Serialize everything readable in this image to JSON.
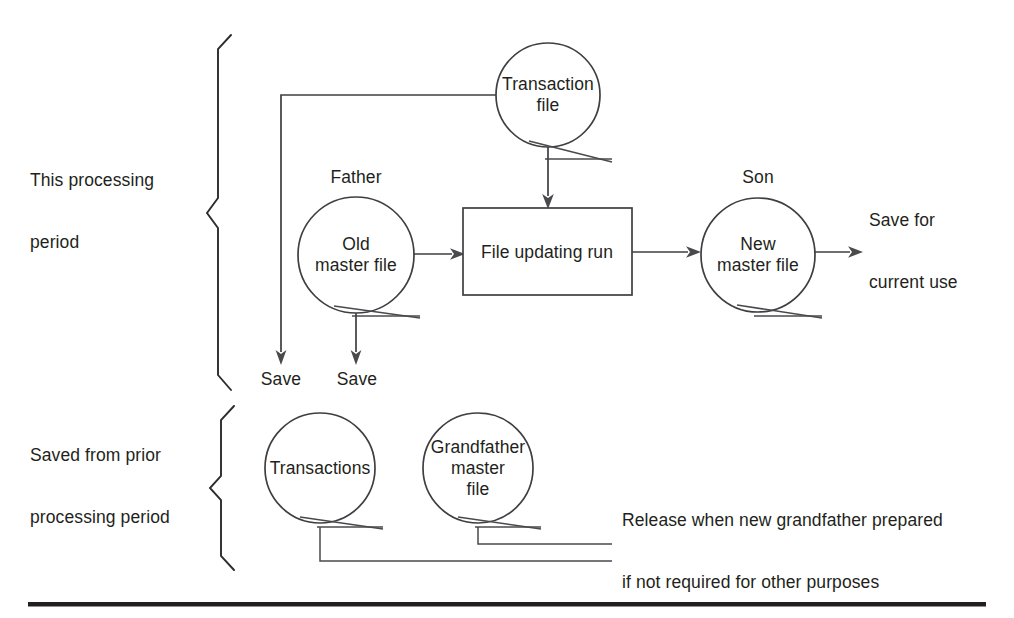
{
  "diagram": {
    "type": "flowchart",
    "stroke_color": "#3f3f42",
    "text_color": "#231f20",
    "background": "#ffffff"
  },
  "sections": {
    "current": {
      "label": "This processing\nperiod",
      "label_line1": "This processing",
      "label_line2": "period"
    },
    "prior": {
      "label": "Saved from prior\nprocessing period",
      "label_line1": "Saved from prior",
      "label_line2": "processing period"
    }
  },
  "nodes": {
    "transaction_file": {
      "label": "Transaction\nfile",
      "generation_tag": ""
    },
    "old_master_file": {
      "label": "Old\nmaster file",
      "generation_tag": "Father"
    },
    "file_updating_run": {
      "label": "File updating run"
    },
    "new_master_file": {
      "label": "New\nmaster file",
      "generation_tag": "Son"
    },
    "transactions_prior": {
      "label": "Transactions"
    },
    "grandfather_master_file": {
      "label": "Grandfather\nmaster\nfile"
    }
  },
  "annotations": {
    "save_transaction": "Save",
    "save_old_master": "Save",
    "save_current_use": "Save for\ncurrent use",
    "save_current_use_line1": "Save for",
    "save_current_use_line2": "current use",
    "release_note": "Release when new grandfather prepared\nif not required for other purposes",
    "release_note_line1": "Release when new grandfather prepared",
    "release_note_line2": "if not required for other purposes"
  }
}
